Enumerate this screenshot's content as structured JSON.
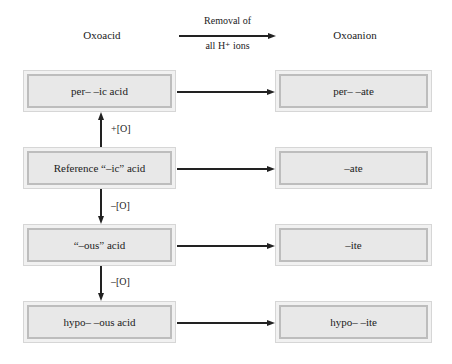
{
  "headers": {
    "left": "Oxoacid",
    "right": "Oxoanion",
    "arrow_top": "Removal of",
    "arrow_bottom": "all H⁺ ions"
  },
  "acids": [
    {
      "label": "per– –ic acid"
    },
    {
      "label": "Reference “–ic” acid"
    },
    {
      "label": "“–ous” acid"
    },
    {
      "label": "hypo– –ous acid"
    }
  ],
  "anions": [
    {
      "label": "per– –ate"
    },
    {
      "label": "–ate"
    },
    {
      "label": "–ite"
    },
    {
      "label": "hypo– –ite"
    }
  ],
  "transitions": [
    {
      "label": "+[O]",
      "direction": "up"
    },
    {
      "label": "–[O]",
      "direction": "down"
    },
    {
      "label": "–[O]",
      "direction": "down"
    }
  ],
  "colors": {
    "box_fill": "#e8e8e8",
    "box_border": "#bdbdbd",
    "arrow": "#222222"
  }
}
